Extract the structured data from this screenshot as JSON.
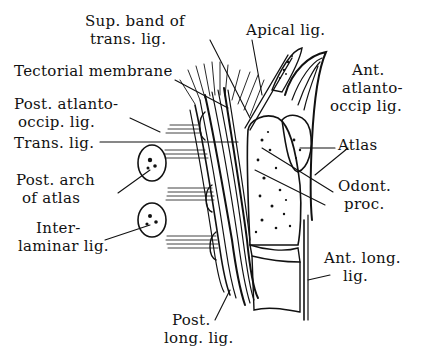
{
  "labels": {
    "sup_band_1": "Sup. band of",
    "sup_band_2": "trans. lig.",
    "apical": "Apical lig.",
    "tectorial": "Tectorial membrane",
    "ant_ao_1": "Ant.",
    "ant_ao_2": "atlanto-",
    "ant_ao_3": "occip lig.",
    "post_ao_1": "Post. atlanto-",
    "post_ao_2": "occip. lig.",
    "trans": "Trans. lig.",
    "atlas": "Atlas",
    "post_arch_1": "Post. arch",
    "post_arch_2": "of atlas",
    "odont_1": "Odont.",
    "odont_2": "proc.",
    "interlam_1": "Inter-",
    "interlam_2": "laminar lig.",
    "ant_long_1": "Ant. long.",
    "ant_long_2": "lig.",
    "post_long_1": "Post.",
    "post_long_2": "long. lig."
  },
  "colors": {
    "ink": "#111111",
    "paper": "#ffffff"
  }
}
